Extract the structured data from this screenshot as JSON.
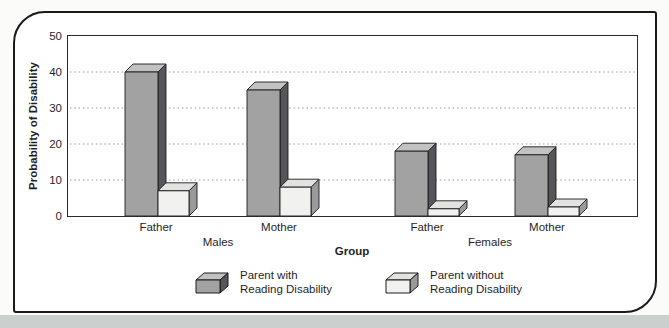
{
  "chart_data": {
    "type": "bar",
    "style": "3d-grouped-columns",
    "xlabel": "Group",
    "ylabel": "Probability of Disability",
    "ylim": [
      0,
      50
    ],
    "yticks": [
      0,
      10,
      20,
      30,
      40,
      50
    ],
    "gridlines": [
      10,
      20,
      30,
      40
    ],
    "grid_style": "dotted-horizontal",
    "legend_position": "bottom",
    "group_sections": [
      "Males",
      "Females"
    ],
    "tick_labels": [
      "Father",
      "Mother",
      "Father",
      "Mother"
    ],
    "categories": [
      "Males - Father",
      "Males - Mother",
      "Females - Father",
      "Females - Mother"
    ],
    "series": [
      {
        "name": "Parent with Reading Disability",
        "values": [
          40,
          35,
          18,
          17
        ]
      },
      {
        "name": "Parent without Reading Disability",
        "values": [
          7,
          8,
          2,
          2.5
        ]
      }
    ]
  },
  "legend": {
    "items": [
      {
        "line1": "Parent with",
        "line2": "Reading Disability"
      },
      {
        "line1": "Parent without",
        "line2": "Reading Disability"
      }
    ]
  },
  "colors": {
    "with_rd": {
      "front": "#a2a2a2",
      "top": "#c2c2c2",
      "side": "#55555a"
    },
    "without_rd": {
      "front": "#f1f1ef",
      "top": "#e2e2e0",
      "side": "#9a9a9c"
    },
    "gridline": "#9a9a9a",
    "axis_frame": "#2a2a2a",
    "outer_frame": "#1a1a1a",
    "text": "#1f1f1f",
    "page_strip": "#cbd0ce"
  }
}
